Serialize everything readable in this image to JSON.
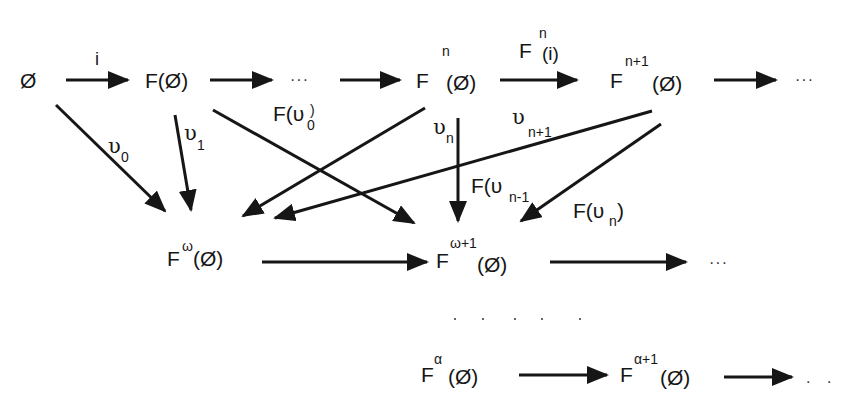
{
  "diagram": {
    "nodes": {
      "empty": "Ø",
      "f_empty": "F(Ø)",
      "ellipsis_row1": "···",
      "fn": {
        "base": "F",
        "sup": "n",
        "arg": "(Ø)"
      },
      "fn1": {
        "base": "F",
        "sup": "n+1",
        "arg": "(Ø)"
      },
      "ellipsis_row1_end": "···",
      "fomega": {
        "base": "F",
        "sup": "ω",
        "arg": "(Ø)"
      },
      "fomega1": {
        "base": "F",
        "sup": "ω+1",
        "arg": "(Ø)"
      },
      "ellipsis_row2_end": "···",
      "falpha": {
        "base": "F",
        "sup": "α",
        "arg": "(Ø)"
      },
      "falpha1": {
        "base": "F",
        "sup": "α+1",
        "arg": "(Ø)"
      },
      "ellipsis_row3_end": ". ."
    },
    "edge_labels": {
      "i": "i",
      "fn_i": {
        "base": "F",
        "sup": "n",
        "arg": "(i)"
      },
      "upsilon0": {
        "sym": "υ",
        "sub": "0"
      },
      "upsilon1": {
        "sym": "υ",
        "sub": "1"
      },
      "f_upsilon0": {
        "pre": "F(υ",
        "sub": "0",
        "post": ")"
      },
      "upsilon_n": {
        "sym": "υ",
        "sub": "n"
      },
      "upsilon_n1": {
        "sym": "υ",
        "sub": "n+1"
      },
      "f_upsilon_n_minus1": {
        "pre": "F(υ",
        "sub": "n-1",
        "post": ")"
      },
      "f_upsilon_n": {
        "pre": "F(υ",
        "sub": "n",
        "post": ")"
      }
    },
    "edges": [
      {
        "from": "Ø",
        "to": "F(Ø)",
        "label": "i"
      },
      {
        "from": "F(Ø)",
        "to": "···"
      },
      {
        "from": "···",
        "to": "F^n(Ø)"
      },
      {
        "from": "F^n(Ø)",
        "to": "F^{n+1}(Ø)",
        "label": "F^n(i)"
      },
      {
        "from": "F^{n+1}(Ø)",
        "to": "···"
      },
      {
        "from": "Ø",
        "to": "F^ω(Ø)",
        "label": "υ0"
      },
      {
        "from": "F(Ø)",
        "to": "F^ω(Ø)",
        "label": "υ1"
      },
      {
        "from": "F(Ø)",
        "to": "F^{ω+1}(Ø)",
        "label": "F(υ0)"
      },
      {
        "from": "F^n(Ø)",
        "to": "F^ω(Ø)",
        "label": "υn"
      },
      {
        "from": "F^n(Ø)",
        "to": "F^{ω+1}(Ø)",
        "label": "F(υn-1)"
      },
      {
        "from": "F^{n+1}(Ø)",
        "to": "F^ω(Ø)",
        "label": "υn+1"
      },
      {
        "from": "F^{n+1}(Ø)",
        "to": "F^{ω+1}(Ø)",
        "label": "F(υn)"
      },
      {
        "from": "F^ω(Ø)",
        "to": "F^{ω+1}(Ø)"
      },
      {
        "from": "F^{ω+1}(Ø)",
        "to": "···"
      },
      {
        "from": "F^α(Ø)",
        "to": "F^{α+1}(Ø)"
      },
      {
        "from": "F^{α+1}(Ø)",
        "to": ". ."
      }
    ],
    "colors": {
      "ink": "#161616",
      "background": "#ffffff"
    }
  }
}
